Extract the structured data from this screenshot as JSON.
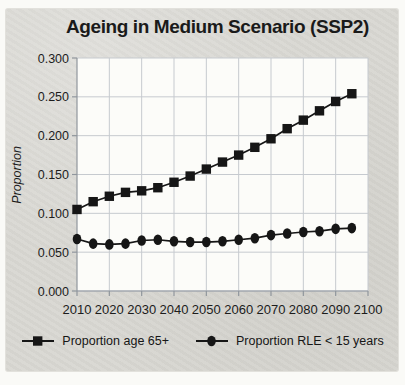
{
  "chart_data": {
    "type": "line",
    "title": "Ageing in Medium Scenario (SSP2)",
    "xlabel": "",
    "ylabel": "Proportion",
    "x": [
      2010,
      2015,
      2020,
      2025,
      2030,
      2035,
      2040,
      2045,
      2050,
      2055,
      2060,
      2065,
      2070,
      2075,
      2080,
      2085,
      2090,
      2095
    ],
    "series": [
      {
        "name": "Proportion age 65+",
        "marker": "square",
        "values": [
          0.105,
          0.115,
          0.122,
          0.127,
          0.129,
          0.133,
          0.14,
          0.148,
          0.157,
          0.166,
          0.175,
          0.185,
          0.196,
          0.209,
          0.22,
          0.232,
          0.244,
          0.254
        ]
      },
      {
        "name": "Proportion RLE < 15 years",
        "marker": "circle",
        "values": [
          0.067,
          0.061,
          0.06,
          0.061,
          0.065,
          0.066,
          0.064,
          0.063,
          0.063,
          0.064,
          0.066,
          0.068,
          0.072,
          0.074,
          0.076,
          0.077,
          0.08,
          0.081
        ]
      }
    ],
    "xlim": [
      2010,
      2100
    ],
    "ylim": [
      0,
      0.3
    ],
    "xticks": [
      2010,
      2020,
      2030,
      2040,
      2050,
      2060,
      2070,
      2080,
      2090,
      2100
    ],
    "yticks": [
      "0.300",
      "0.250",
      "0.200",
      "0.150",
      "0.100",
      "0.050",
      "0.000"
    ],
    "grid": true,
    "legend_position": "bottom",
    "colors": {
      "series": "#161616",
      "grid": "#c6cacf",
      "axis": "#90969d",
      "figure_background": "#d8d7d2",
      "plot_background": "#fcfcf9",
      "page_background": "#fafaf7",
      "text": "#1c1c1c"
    }
  }
}
